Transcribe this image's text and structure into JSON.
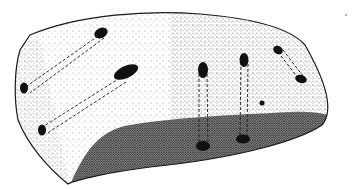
{
  "figure": {
    "colors": {
      "background": "#ffffff",
      "ink": "#1a1a1a",
      "shade": "#555555"
    },
    "holes": [
      {
        "name": "top-left-hole",
        "x": 101,
        "y": 33
      },
      {
        "name": "left-edge-hole-upper",
        "x": 24,
        "y": 88
      },
      {
        "name": "center-hole",
        "x": 124,
        "y": 73
      },
      {
        "name": "left-edge-hole-lower",
        "x": 42,
        "y": 130
      },
      {
        "name": "mid-right-hole-top",
        "x": 203,
        "y": 70
      },
      {
        "name": "mid-right-hole-bottom",
        "x": 203,
        "y": 146
      },
      {
        "name": "right-hole-top",
        "x": 244,
        "y": 60
      },
      {
        "name": "right-hole-bottom",
        "x": 243,
        "y": 139
      },
      {
        "name": "far-right-hole-top",
        "x": 278,
        "y": 50
      },
      {
        "name": "far-right-hole-bottom",
        "x": 300,
        "y": 79
      },
      {
        "name": "small-dot",
        "x": 262,
        "y": 103
      }
    ]
  }
}
